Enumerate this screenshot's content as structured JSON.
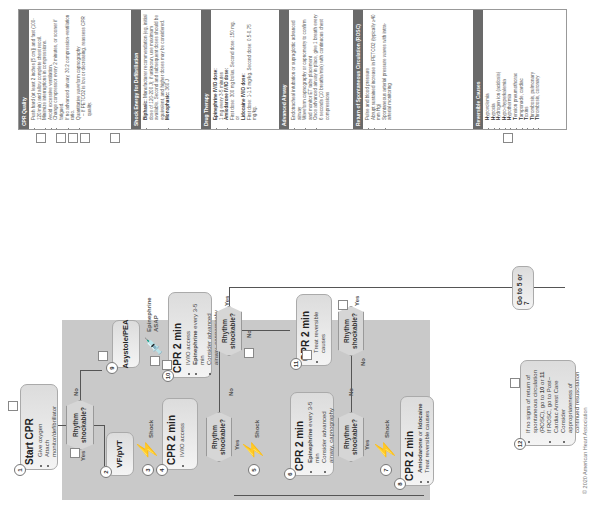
{
  "panels": {
    "cpr_quality": {
      "title": "CPR Quality",
      "items": [
        "Push hard (at least 2 inches [5 cm]) and fast (100-120/min) and allow complete chest recoil.",
        "Minimize interruptions in compressions.",
        "Avoid excessive ventilation.",
        "Change compressor every 2 minutes, or sooner if fatigued.",
        "If no advanced airway, 30:2 compression-ventilation ratio.",
        "Quantitative waveform capnography",
        "– If PETCO2 is low or decreasing, reassess CPR quality."
      ]
    },
    "shock_energy": {
      "title": "Shock Energy for Defibrillation",
      "biphasic_label": "Biphasic:",
      "biphasic_text": "Manufacturer recommendation (eg, initial dose of 120-200 J); if unknown, use maximum available. Second and subsequent doses should be equivalent, and higher doses may be considered.",
      "monophasic_label": "Monophasic:",
      "monophasic_text": "360 J"
    },
    "drug_therapy": {
      "title": "Drug Therapy",
      "epi_label": "Epinephrine IV/IO dose:",
      "epi_text": "1 mg every 3-5 minutes",
      "amio_label": "Amiodarone IV/IO dose:",
      "amio_text": "First dose: 300 mg bolus. Second dose: 150 mg.",
      "or": "or",
      "lido_label": "Lidocaine IV/IO dose:",
      "lido_text": "First dose: 1-1.5 mg/kg. Second dose: 0.5-0.75 mg/kg."
    },
    "advanced_airway": {
      "title": "Advanced Airway",
      "items": [
        "Endotracheal intubation or supraglottic advanced airway",
        "Waveform capnography or capnometry to confirm and monitor ET tube placement",
        "Once advanced airway in place, give 1 breath every 6 seconds (10 breaths/min) with continuous chest compressions"
      ]
    },
    "rosc": {
      "title": "Return of Spontaneous Circulation (ROSC)",
      "items": [
        "Pulse and blood pressure",
        "Abrupt sustained increase in PETCO2 (typically ≥40 mm Hg)",
        "Spontaneous arterial pressure waves with intra-arterial monitoring"
      ]
    },
    "reversible_causes": {
      "title": "Reversible Causes",
      "items": [
        {
          "b": "H",
          "t": "ypovolemia"
        },
        {
          "b": "H",
          "t": "ypoxia"
        },
        {
          "b": "H",
          "t": "ydrogen ion (acidosis)"
        },
        {
          "b": "H",
          "t": "ypo-/hyperkalemia"
        },
        {
          "b": "H",
          "t": "ypothermia"
        },
        {
          "b": "T",
          "t": "ension pneumothorax"
        },
        {
          "b": "T",
          "t": "amponade, cardiac"
        },
        {
          "b": "T",
          "t": "oxins"
        },
        {
          "b": "T",
          "t": "hrombosis, pulmonary"
        },
        {
          "b": "T",
          "t": "hrombosis, coronary"
        }
      ]
    }
  },
  "flow": {
    "n1": {
      "num": "1",
      "title": "Start CPR",
      "items": [
        "Give oxygen",
        "Attach monitor/defibrillator"
      ]
    },
    "d1": {
      "text": "Rhythm shockable?"
    },
    "yes": "Yes",
    "no": "No",
    "shock": "Shock",
    "n2": {
      "num": "2",
      "title": "VF/pVT"
    },
    "n3": {
      "num": "3"
    },
    "n4": {
      "num": "4",
      "title": "CPR 2 min",
      "items": [
        "IV/IO access"
      ]
    },
    "d2": {
      "text": "Rhythm shockable?"
    },
    "n5": {
      "num": "5"
    },
    "n6": {
      "num": "6",
      "title": "CPR 2 min",
      "items_b": [
        "Epinephrine",
        ""
      ],
      "items": [
        " every 3-5 min",
        "Consider advanced airway, capnography"
      ]
    },
    "d3": {
      "text": "Rhythm shockable?"
    },
    "n7": {
      "num": "7"
    },
    "n8": {
      "num": "8",
      "title": "CPR 2 min",
      "amio_b": "Amiodarone",
      "amio_or": " or ",
      "lido_b": "lidocaine",
      "item2": "Treat reversible causes"
    },
    "n9": {
      "num": "9",
      "title": "Asystole/PEA"
    },
    "epi_asap": "Epinephrine ASAP",
    "n10": {
      "num": "10",
      "title": "CPR 2 min",
      "item1": "IV/IO access",
      "item2_b": "Epinephrine",
      "item2": " every 3-5 min",
      "item3": "Consider advanced airway, capnography"
    },
    "d4": {
      "text": "Rhythm shockable?"
    },
    "n11": {
      "num": "11",
      "title": "CPR 2 min",
      "items": [
        "Treat reversible causes"
      ]
    },
    "d5": {
      "text": "Rhythm shockable?"
    },
    "goto": "Go to 5 or 7",
    "n12": {
      "num": "12",
      "line1a": "If no signs of return of spontaneous circulation (ROSC), go to ",
      "line1b": "10",
      "line1c": " or ",
      "line1d": "11",
      "line2": "If ROSC, go to Post–Cardiac Arrest Care",
      "line3": "Consider appropriateness of continued resuscitation"
    }
  },
  "copyright": "© 2020 American Heart Association",
  "colors": {
    "shade": "#c9c9c9",
    "panel_header": "#6a6a6a"
  }
}
